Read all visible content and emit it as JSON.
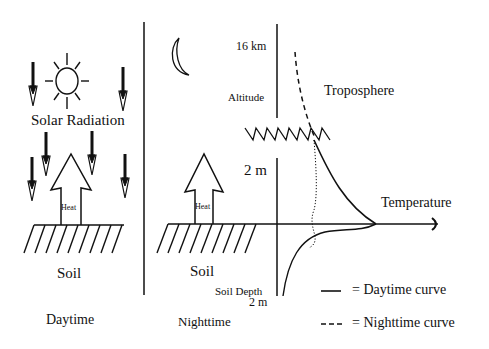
{
  "daytime_panel": {
    "solar_label": "Solar Radiation",
    "heat_label": "Heat",
    "soil_label": "Soil",
    "caption": "Daytime"
  },
  "nighttime_panel": {
    "heat_label": "Heat",
    "soil_label": "Soil",
    "caption": "Nighttime"
  },
  "profile": {
    "altitude_top_tick": "16 km",
    "altitude_label": "Altitude",
    "troposphere_label": "Troposphere",
    "altitude_2m_tick": "2 m",
    "temperature_label": "Temperature",
    "soil_depth_label": "Soil Depth",
    "soil_depth_tick": "2 m"
  },
  "legend": {
    "day_label": "= Daytime curve",
    "night_label": "= Nighttime curve"
  },
  "colors": {
    "ink": "#111111",
    "background": "#ffffff"
  }
}
